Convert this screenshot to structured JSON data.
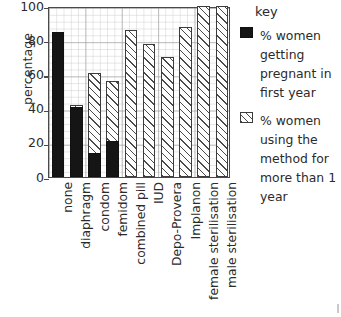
{
  "chart_data": {
    "type": "bar",
    "title": "",
    "xlabel": "",
    "ylabel": "percentage",
    "ylim": [
      0,
      100
    ],
    "yticks": [
      0,
      20,
      40,
      60,
      80,
      100
    ],
    "grid": true,
    "legend_position": "right",
    "legend_title": "key",
    "categories": [
      "none",
      "diaphragm",
      "condom",
      "femidom",
      "combined pill",
      "IUD",
      "Depo-Provera",
      "Implanon",
      "female sterilisation",
      "male sterilisation"
    ],
    "series": [
      {
        "name": "% women getting pregnant in first year",
        "style": "solid-black",
        "color": "#151515",
        "values": [
          85,
          41,
          14,
          21,
          null,
          null,
          null,
          null,
          null,
          null
        ]
      },
      {
        "name": "% women using the method for more than 1 year",
        "style": "hatched",
        "color": "#ffffff",
        "values": [
          null,
          42,
          61,
          56,
          86,
          78,
          70,
          88,
          100,
          100
        ]
      }
    ]
  },
  "axis": {
    "y_label": "percentage",
    "y_ticks": [
      "0",
      "20",
      "40",
      "60",
      "80",
      "100"
    ]
  },
  "legend": {
    "title": "key",
    "entries": [
      {
        "swatch": "solid-black-swatch",
        "label": "% women getting pregnant in first year"
      },
      {
        "swatch": "hatched-swatch",
        "label": "% women using the method for more than 1 year"
      }
    ]
  }
}
